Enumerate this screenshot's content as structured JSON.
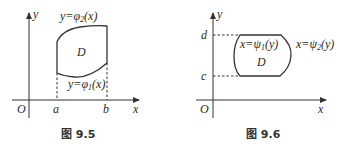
{
  "figures": [
    {
      "id": "fig-9-5",
      "caption": "图 9.5",
      "axis_x_label": "x",
      "axis_y_label": "y",
      "origin_label": "O",
      "tick_labels": {
        "a": "a",
        "b": "b"
      },
      "region_label": "D",
      "upper_curve": {
        "lhs": "y=",
        "func": "φ",
        "sub": "2",
        "arg": "(x)"
      },
      "lower_curve": {
        "lhs": "y=",
        "func": "φ",
        "sub": "1",
        "arg": "(x)"
      }
    },
    {
      "id": "fig-9-6",
      "caption": "图 9.6",
      "axis_x_label": "x",
      "axis_y_label": "y",
      "origin_label": "O",
      "tick_labels": {
        "c": "c",
        "d": "d"
      },
      "region_label": "D",
      "left_curve": {
        "lhs": "x=",
        "func": "ψ",
        "sub": "1",
        "arg": "(y)"
      },
      "right_curve": {
        "lhs": "x=",
        "func": "ψ",
        "sub": "2",
        "arg": "(y)"
      }
    }
  ],
  "colors": {
    "stroke": "#333333",
    "text": "#2a2a2a",
    "background": "#ffffff"
  }
}
